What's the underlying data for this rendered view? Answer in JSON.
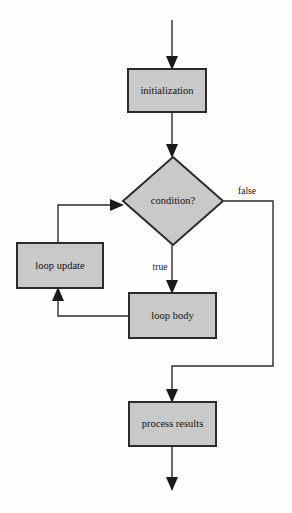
{
  "diagram": {
    "background_color": "#fefefe",
    "node_fill_color": "#c9c9c9",
    "node_stroke_color": "#2b2b2b",
    "edge_color": "#2b2b2b",
    "text_color": "#14100f"
  },
  "nodes": {
    "initialization": {
      "label": "initialization",
      "shape": "rectangle",
      "x": 128,
      "y": 69,
      "width": 78,
      "height": 43,
      "center_x": 167,
      "center_y": 90.5
    },
    "condition": {
      "label": "condition?",
      "shape": "diamond",
      "center_x": 173,
      "center_y": 201,
      "half_width": 50,
      "half_height": 44
    },
    "loop_update": {
      "label": "loop update",
      "shape": "rectangle",
      "x": 17,
      "y": 243,
      "width": 86,
      "height": 45,
      "center_x": 60,
      "center_y": 265.5
    },
    "loop_body": {
      "label": "loop body",
      "shape": "rectangle",
      "x": 129,
      "y": 293,
      "width": 87,
      "height": 45,
      "center_x": 172.5,
      "center_y": 315.5
    },
    "process_results": {
      "label": "process results",
      "shape": "rectangle",
      "x": 129,
      "y": 402,
      "width": 87,
      "height": 44,
      "center_x": 172.5,
      "center_y": 424
    }
  },
  "edges": {
    "entry_to_initialization": {
      "label": "",
      "from": "start",
      "to": "initialization",
      "path": "M 172 20 L 172 63",
      "arrow_at": {
        "x": 172,
        "y": 69,
        "direction": "down"
      }
    },
    "initialization_to_condition": {
      "label": "",
      "from": "initialization",
      "to": "condition",
      "path": "M 172 112 L 172 151",
      "arrow_at": {
        "x": 172,
        "y": 157,
        "direction": "down"
      }
    },
    "condition_true_to_loop_body": {
      "label": "true",
      "from": "condition",
      "to": "loop_body",
      "path": "M 172 245 L 172 287",
      "arrow_at": {
        "x": 172,
        "y": 293,
        "direction": "down"
      },
      "label_x": 160,
      "label_y": 267
    },
    "condition_false_to_process_results": {
      "label": "false",
      "from": "condition",
      "to": "process_results",
      "path": "M 224 201 L 273 201 L 273 366 L 172 366 L 172 396",
      "arrow_at": {
        "x": 172,
        "y": 402,
        "direction": "down"
      },
      "label_x": 247,
      "label_y": 192
    },
    "loop_body_to_loop_update": {
      "label": "",
      "from": "loop_body",
      "to": "loop_update",
      "path": "M 129 316 L 58 316 L 58 294",
      "arrow_at": {
        "x": 58,
        "y": 288,
        "direction": "up"
      }
    },
    "loop_update_to_condition": {
      "label": "",
      "from": "loop_update",
      "to": "condition",
      "path": "M 58 243 L 58 205 L 117 205",
      "arrow_at": {
        "x": 123,
        "y": 205,
        "direction": "right"
      }
    },
    "process_results_to_exit": {
      "label": "",
      "from": "process_results",
      "to": "end",
      "path": "M 172 446 L 172 484",
      "arrow_at": {
        "x": 172,
        "y": 490,
        "direction": "down"
      }
    }
  }
}
